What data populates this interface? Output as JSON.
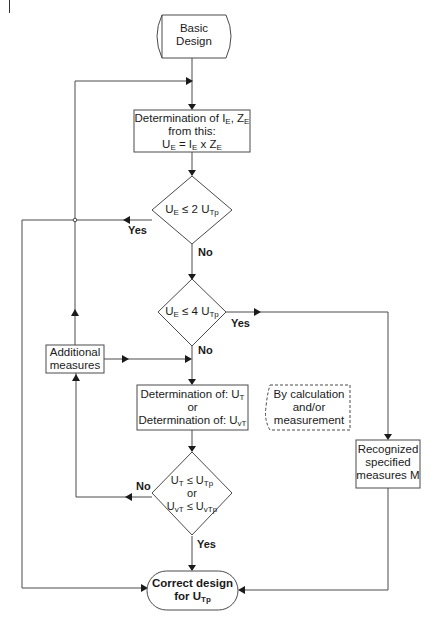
{
  "diagram": {
    "type": "flowchart",
    "nodes": {
      "start": {
        "shape": "terminal",
        "lines": [
          "Basic",
          "Design"
        ]
      },
      "determine_ie_ze": {
        "shape": "process",
        "line1": {
          "text": "Determination of I",
          "sub1": "E",
          "mid": ", Z",
          "sub2": "E"
        },
        "line2": "from this:",
        "line3": {
          "a": "U",
          "sa": "E",
          "b": " = I",
          "sb": "E",
          "c": " x Z",
          "sc": "E"
        }
      },
      "decision_2utp": {
        "shape": "decision",
        "a": "U",
        "sa": "E",
        "b": " ≤ 2 U",
        "sb": "Tp"
      },
      "decision_4utp": {
        "shape": "decision",
        "a": "U",
        "sa": "E",
        "b": " ≤ 4 U",
        "sb": "Tp"
      },
      "additional_measures": {
        "shape": "process",
        "lines": [
          "Additional",
          "measures"
        ]
      },
      "determine_ut": {
        "shape": "process",
        "line1": {
          "text": "Determination of: U",
          "sub": "T"
        },
        "line2": "or",
        "line3": {
          "text": "Determination of: U",
          "sub": "vT"
        }
      },
      "note": {
        "shape": "annotation-dashed",
        "lines": [
          "By calculation",
          "and/or",
          "measurement"
        ]
      },
      "recognized": {
        "shape": "process",
        "lines": [
          "Recognized",
          "specified",
          "measures M"
        ]
      },
      "decision_ut": {
        "shape": "decision",
        "line1": {
          "a": "U",
          "sa": "T",
          "b": " ≤ U",
          "sb": "Tp"
        },
        "line2": "or",
        "line3": {
          "a": "U",
          "sa": "vT",
          "b": " ≤ U",
          "sb": "vTp"
        }
      },
      "end": {
        "shape": "terminal",
        "line1": "Correct design",
        "line2": {
          "text": "for U",
          "sub": "Tp"
        }
      }
    },
    "edge_labels": {
      "d1_yes": "Yes",
      "d1_no": "No",
      "d2_yes": "Yes",
      "d2_no": "No",
      "d3_no": "No",
      "d3_yes": "Yes"
    },
    "edges": [
      {
        "from": "start",
        "to": "determine_ie_ze"
      },
      {
        "from": "determine_ie_ze",
        "to": "decision_2utp"
      },
      {
        "from": "decision_2utp",
        "to": "end",
        "label": "Yes"
      },
      {
        "from": "decision_2utp",
        "to": "decision_4utp",
        "label": "No"
      },
      {
        "from": "decision_4utp",
        "to": "recognized",
        "label": "Yes"
      },
      {
        "from": "decision_4utp",
        "to": "determine_ut",
        "label": "No"
      },
      {
        "from": "additional_measures",
        "to": "determine_ie_ze"
      },
      {
        "from": "additional_measures",
        "to": "determine_ut"
      },
      {
        "from": "determine_ut",
        "to": "decision_ut"
      },
      {
        "from": "decision_ut",
        "to": "additional_measures",
        "label": "No"
      },
      {
        "from": "decision_ut",
        "to": "end",
        "label": "Yes"
      },
      {
        "from": "recognized",
        "to": "end"
      }
    ]
  }
}
